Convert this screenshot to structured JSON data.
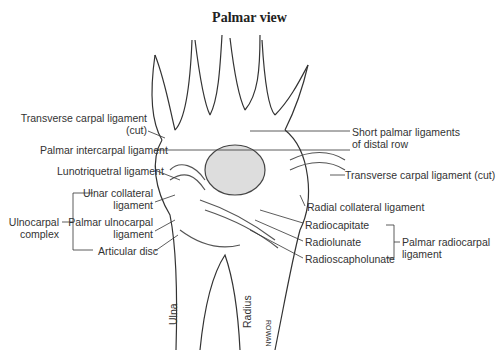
{
  "title": "Palmar view",
  "labels": {
    "transverse_carpal_cut_left_line1": "Transverse carpal ligament",
    "transverse_carpal_cut_left_line2": "(cut)",
    "palmar_intercarpal": "Palmar intercarpal ligament",
    "lunotriquetral": "Lunotriquetral ligament",
    "ulnar_collateral_line1": "Ulnar collateral",
    "ulnar_collateral_line2": "ligament",
    "palmar_ulnocarpal_line1": "Palmar ulnocarpal",
    "palmar_ulnocarpal_line2": "ligament",
    "articular_disc": "Articular disc",
    "ulnocarpal_complex_line1": "Ulnocarpal",
    "ulnocarpal_complex_line2": "complex",
    "short_palmar_line1": "Short palmar ligaments",
    "short_palmar_line2": "of distal row",
    "transverse_carpal_cut_right": "Transverse carpal ligament (cut)",
    "radial_collateral": "Radial collateral ligament",
    "radiocapitate": "Radiocapitate",
    "radiolunate": "Radiolunate",
    "radioscapholunate": "Radioscapholunate",
    "palmar_radiocarpal_line1": "Palmar radiocarpal",
    "palmar_radiocarpal_line2": "ligament",
    "ulna": "Ulna",
    "radius": "Radius",
    "signature": "ROWAN"
  }
}
